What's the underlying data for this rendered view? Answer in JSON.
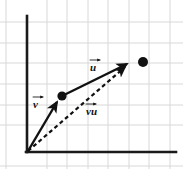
{
  "figure": {
    "background_color": "#ffffff"
  },
  "grid": {
    "line_color": "#d8d8d8",
    "line_width": 1,
    "spacing_px": 20.5,
    "vertical_lines_x": [
      6,
      26,
      47,
      67,
      88,
      108,
      129,
      149,
      170
    ],
    "horizontal_lines_y": [
      22,
      43,
      63,
      84,
      105,
      125,
      146,
      166
    ]
  },
  "axes": {
    "color": "#1a1a1a",
    "line_width": 2.5,
    "origin": {
      "x": 27,
      "y": 152
    },
    "y_axis": {
      "x": 27,
      "y_top": 16,
      "y_bottom": 152
    },
    "x_axis": {
      "y": 152,
      "x_left": 27,
      "x_right": 176
    }
  },
  "vectors": [
    {
      "name": "v",
      "label": "v",
      "style": "solid",
      "color": "#111111",
      "line_width": 2.4,
      "start": {
        "x": 28,
        "y": 151
      },
      "end": {
        "x": 60,
        "y": 98
      },
      "arrowhead": true,
      "label_position": {
        "x": 33,
        "y": 99
      }
    },
    {
      "name": "u",
      "label": "u",
      "style": "solid",
      "color": "#111111",
      "line_width": 2.4,
      "start": {
        "x": 64,
        "y": 95
      },
      "end": {
        "x": 131,
        "y": 62
      },
      "arrowhead": true,
      "label_position": {
        "x": 90,
        "y": 62
      }
    },
    {
      "name": "vu",
      "label": "vu",
      "style": "dashed",
      "color": "#111111",
      "line_width": 2.2,
      "dash_pattern": "4 3",
      "start": {
        "x": 28,
        "y": 151
      },
      "end": {
        "x": 129,
        "y": 64
      },
      "arrowhead": true,
      "label_position": {
        "x": 86,
        "y": 106
      }
    }
  ],
  "points": [
    {
      "name": "origin-point",
      "x": 27,
      "y": 152,
      "radius": 0,
      "filled": false
    },
    {
      "name": "intermediate-point",
      "x": 62,
      "y": 96,
      "radius": 4.6,
      "filled": true,
      "color": "#111111"
    },
    {
      "name": "endpoint-point",
      "x": 143,
      "y": 62,
      "radius": 5.0,
      "filled": true,
      "color": "#111111"
    }
  ]
}
